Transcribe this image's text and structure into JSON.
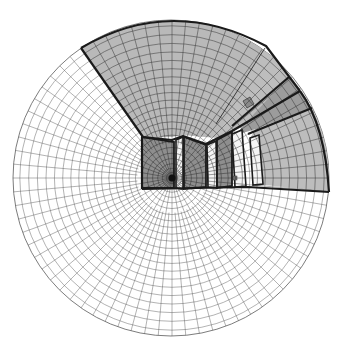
{
  "diagram": {
    "type": "fisheye-perspective-room-grid",
    "canvas": {
      "width": 342,
      "height": 349,
      "background": "#ffffff"
    },
    "sphere": {
      "cx": 171,
      "cy": 178,
      "r": 158
    },
    "vanishing_point": {
      "cx": 172,
      "cy": 178,
      "r": 3.5,
      "color": "#111111"
    },
    "grid": {
      "radial_lines": 72,
      "rings": 24,
      "stroke": "#555555",
      "stroke_width": 0.45
    },
    "colors": {
      "ceiling": "#b9b9b9",
      "back_wall": "#8e8e8e",
      "right_wall": "#bdbdbd",
      "right_band": "#9c9c9c",
      "window_glass": "#f4f4f4",
      "column": "#8a8a8a",
      "outline": "#1a1a1a"
    },
    "surfaces": [
      {
        "name": "ceiling",
        "fill": "ceiling",
        "points": "81,48 110,33 140,23 171,19 201,21 232,29 264,46 289,76 300,91 242,127 219,138 205,137 182,135 172,137 143,138 92,62"
      },
      {
        "name": "right-wall-upper",
        "fill": "right_wall",
        "points": "265,46 289,76 243,126 220,138 215,140"
      },
      {
        "name": "right-band",
        "fill": "right_band",
        "points": "289,76 300,91 312,108 256,129 236,135 242,127"
      },
      {
        "name": "right-wall-lower",
        "fill": "right_wall",
        "points": "312,108 320,125 326,145 329,170 329,192 265,185 255,186 250,138 256,129"
      },
      {
        "name": "back-wall-left",
        "fill": "back_wall",
        "points": "142,137 174,142 174,188 142,188"
      },
      {
        "name": "back-wall-mid",
        "fill": "back_wall",
        "points": "184,137 206,145 206,187 184,189"
      },
      {
        "name": "back-wall-right",
        "fill": "back_wall",
        "points": "217,140 232,132 232,186 217,188"
      }
    ],
    "windows": [
      {
        "name": "window-1",
        "points": "176,140 183,137 183,189 176,188"
      },
      {
        "name": "window-2",
        "points": "207,145 216,141 217,188 208,187"
      },
      {
        "name": "window-3",
        "points": "232,134 242,130 246,186 235,187"
      },
      {
        "name": "window-4",
        "points": "250,138 259,135 263,184 253,185"
      }
    ],
    "edges": [
      {
        "name": "ceiling-outer-edge",
        "d": "M81,48 Q171,-5 266,46 L300,91"
      },
      {
        "name": "ceiling-left-edge",
        "d": "M81,48 L143,137"
      },
      {
        "name": "ceiling-back-edge",
        "d": "M143,137 L172,140 L183,136 L206,144 L232,131 L300,91"
      },
      {
        "name": "right-band-top",
        "d": "M289,77 L232,126"
      },
      {
        "name": "right-band-bottom",
        "d": "M312,108 L248,134"
      },
      {
        "name": "right-wall-outer",
        "d": "M300,91 Q325,125 329,192"
      },
      {
        "name": "floor-line",
        "d": "M142,189 L248,187 L329,192"
      },
      {
        "name": "back-wall-left-edge",
        "d": "M142,137 L142,189"
      },
      {
        "name": "diagonal-line",
        "d": "M265,48 L216,124"
      }
    ],
    "ceiling_fixture": {
      "points": "243,101 250,97 254,104 247,108",
      "fill": "#8a8a8a"
    },
    "small_marker": {
      "x": 233,
      "y": 176,
      "w": 4,
      "h": 4,
      "fill": "#777777"
    }
  }
}
